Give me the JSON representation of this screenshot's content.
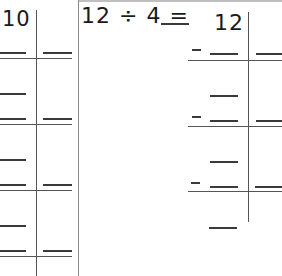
{
  "left_panel": {
    "dividend_partial": "10",
    "rows": 4
  },
  "right_panel": {
    "equation": "12 ÷ 4 =",
    "answer_blank": "",
    "dividend": "12",
    "subtraction_rows": 3,
    "minus_sign": "-"
  },
  "colors": {
    "ink": "#1a1a1a",
    "line": "#555555",
    "border": "#bfbfbf"
  }
}
